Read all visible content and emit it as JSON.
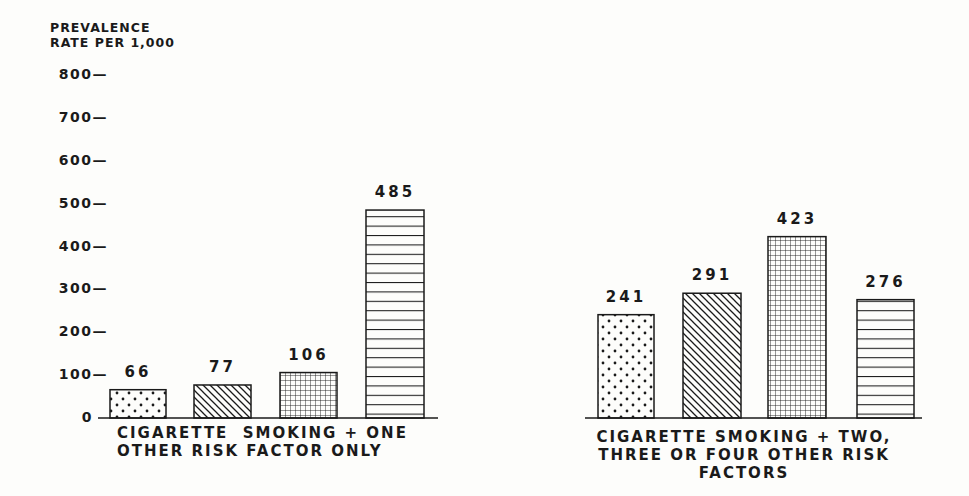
{
  "chart_data": {
    "type": "bar",
    "title": "",
    "ylabel": "PREVALENCE RATE PER 1,000",
    "ylabel_lines": [
      "PREVALENCE",
      "RATE PER 1,000"
    ],
    "ylim": [
      0,
      800
    ],
    "yticks": [
      "800",
      "700",
      "600",
      "500",
      "400",
      "300",
      "200",
      "100",
      "0"
    ],
    "grid": false,
    "legend": null,
    "groups": [
      {
        "caption": "CIGARETTE SMOKING + ONE OTHER RISK FACTOR ONLY",
        "caption_lines": [
          "CIGARETTE  SMOKING + ONE",
          "OTHER RISK FACTOR ONLY"
        ],
        "bars": [
          {
            "pattern": "dots",
            "value": 66,
            "label": "66"
          },
          {
            "pattern": "diagonal",
            "value": 77,
            "label": "77"
          },
          {
            "pattern": "grid",
            "value": 106,
            "label": "106"
          },
          {
            "pattern": "horizontal",
            "value": 485,
            "label": "485"
          }
        ]
      },
      {
        "caption": "CIGARETTE SMOKING + TWO, THREE OR FOUR OTHER RISK FACTORS",
        "caption_lines": [
          "CIGARETTE SMOKING + TWO,",
          "THREE OR FOUR OTHER RISK FACTORS"
        ],
        "bars": [
          {
            "pattern": "dots",
            "value": 241,
            "label": "241"
          },
          {
            "pattern": "diagonal",
            "value": 291,
            "label": "291"
          },
          {
            "pattern": "grid",
            "value": 423,
            "label": "423"
          },
          {
            "pattern": "horizontal",
            "value": 276,
            "label": "276"
          }
        ]
      }
    ],
    "colors": {
      "ink": "#1a1a1a",
      "background": "#fdfdfb"
    }
  }
}
